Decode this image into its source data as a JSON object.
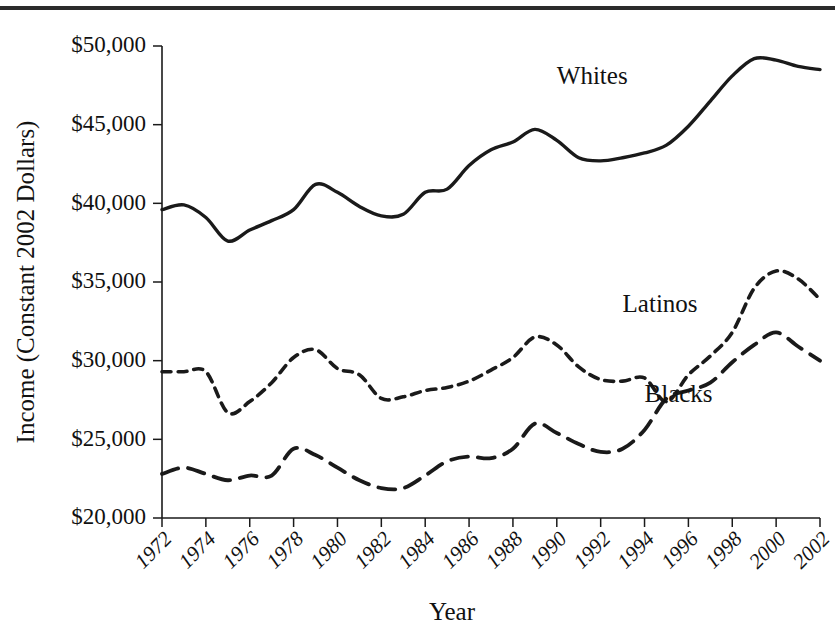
{
  "figure": {
    "top_rule_color": "#2b2b2b",
    "background": "#ffffff",
    "ink_color": "#1a1a1a"
  },
  "axis_titles": {
    "y": "Income (Constant 2002 Dollars)",
    "x": "Year"
  },
  "series_labels": {
    "whites": "Whites",
    "latinos": "Latinos",
    "blacks": "Blacks"
  },
  "chart_data": {
    "type": "line",
    "title": "",
    "xlabel": "Year",
    "ylabel": "Income (Constant 2002 Dollars)",
    "xlim": [
      1972,
      2002
    ],
    "ylim": [
      20000,
      50000
    ],
    "grid": false,
    "legend": "inline-labels",
    "ytick_labels": [
      "$50,000",
      "$45,000",
      "$40,000",
      "$35,000",
      "$30,000",
      "$25,000",
      "$20,000"
    ],
    "ytick_values": [
      50000,
      45000,
      40000,
      35000,
      30000,
      25000,
      20000
    ],
    "xtick_labels": [
      "1972",
      "1974",
      "1976",
      "1978",
      "1980",
      "1982",
      "1984",
      "1986",
      "1988",
      "1990",
      "1992",
      "1994",
      "1996",
      "1998",
      "2000",
      "2002"
    ],
    "xtick_values": [
      1972,
      1974,
      1976,
      1978,
      1980,
      1982,
      1984,
      1986,
      1988,
      1990,
      1992,
      1994,
      1996,
      1998,
      2000,
      2002
    ],
    "x": [
      1972,
      1973,
      1974,
      1975,
      1976,
      1977,
      1978,
      1979,
      1980,
      1981,
      1982,
      1983,
      1984,
      1985,
      1986,
      1987,
      1988,
      1989,
      1990,
      1991,
      1992,
      1993,
      1994,
      1995,
      1996,
      1997,
      1998,
      1999,
      2000,
      2001,
      2002
    ],
    "series": [
      {
        "name": "Whites",
        "style": "solid",
        "label_x": 1990,
        "label_y": 47600,
        "values": [
          39600,
          39900,
          39100,
          37600,
          38300,
          38900,
          39600,
          41200,
          40700,
          39800,
          39200,
          39300,
          40700,
          40900,
          42400,
          43400,
          43900,
          44700,
          44000,
          42900,
          42700,
          42900,
          43200,
          43700,
          44900,
          46500,
          48100,
          49200,
          49100,
          48700,
          48500
        ]
      },
      {
        "name": "Latinos",
        "style": "short-dash",
        "label_x": 1993,
        "label_y": 33100,
        "values": [
          29300,
          29300,
          29300,
          26700,
          27400,
          28600,
          30200,
          30700,
          29500,
          29100,
          27600,
          27700,
          28100,
          28300,
          28700,
          29400,
          30200,
          31500,
          31000,
          29600,
          28800,
          28700,
          28900,
          27400,
          29100,
          30300,
          31800,
          34600,
          35700,
          35200,
          33900
        ]
      },
      {
        "name": "Blacks",
        "style": "long-dash",
        "label_x": 1994,
        "label_y": 27400,
        "values": [
          22800,
          23200,
          22800,
          22400,
          22700,
          22700,
          24400,
          24000,
          23200,
          22400,
          21900,
          21900,
          22700,
          23600,
          23900,
          23800,
          24400,
          26000,
          25400,
          24700,
          24200,
          24400,
          25600,
          27600,
          28100,
          28600,
          29900,
          31000,
          31800,
          30900,
          30000
        ]
      }
    ]
  }
}
